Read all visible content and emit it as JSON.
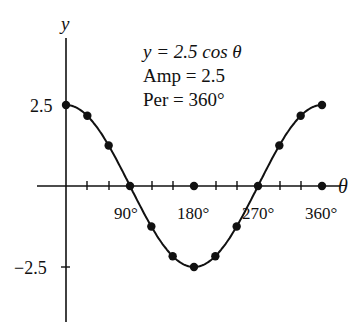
{
  "chart_data": {
    "type": "line",
    "title": "y = 2.5 cos θ",
    "annotations": [
      "y = 2.5 cos θ",
      "Amp = 2.5",
      "Per = 360°"
    ],
    "xlabel": "θ",
    "ylabel": "y",
    "x_ticks": [
      "90°",
      "180°",
      "270°",
      "360°"
    ],
    "y_ticks": [
      "2.5",
      "−2.5"
    ],
    "x": [
      0,
      30,
      60,
      90,
      120,
      150,
      180,
      210,
      240,
      270,
      300,
      330,
      360
    ],
    "series": [
      {
        "name": "y = 2.5 cos θ",
        "values": [
          2.5,
          2.17,
          1.25,
          0,
          -1.25,
          -2.17,
          -2.5,
          -2.17,
          -1.25,
          0,
          1.25,
          2.17,
          2.5
        ]
      }
    ],
    "xlim": [
      0,
      360
    ],
    "ylim": [
      -2.5,
      2.5
    ],
    "grid": false,
    "legend": "none",
    "color": "#111111"
  },
  "labels": {
    "y_axis": "y",
    "x_axis": "θ",
    "eq1": "y = 2.5 cos θ",
    "eq2": "Amp = 2.5",
    "eq3": "Per = 360°",
    "ytick_pos": "2.5",
    "ytick_neg": "−2.5",
    "xtick_90": "90°",
    "xtick_180": "180°",
    "xtick_270": "270°",
    "xtick_360": "360°"
  }
}
